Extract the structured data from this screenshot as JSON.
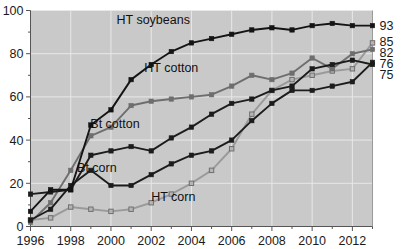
{
  "chart_data": {
    "type": "line",
    "title": "",
    "subtitle": "",
    "xlabel": "",
    "ylabel": "",
    "xlim": [
      1996,
      2013
    ],
    "ylim": [
      0,
      100
    ],
    "grid": true,
    "grid_color": "#e8e8e8",
    "plot_bg": "#c9c9c9",
    "legend": "inline-annotations",
    "x": [
      1996,
      1997,
      1998,
      1999,
      2000,
      2001,
      2002,
      2003,
      2004,
      2005,
      2006,
      2007,
      2008,
      2009,
      2010,
      2011,
      2012,
      2013
    ],
    "xticks": [
      1996,
      1998,
      2000,
      2002,
      2004,
      2006,
      2008,
      2010,
      2012
    ],
    "xtick_labels": [
      "1996",
      "1998",
      "2000",
      "2002",
      "2004",
      "2006",
      "2008",
      "2010",
      "2012"
    ],
    "xminor_ticks": [
      1997,
      1999,
      2001,
      2003,
      2005,
      2007,
      2009,
      2011,
      2013
    ],
    "yticks": [
      0,
      20,
      40,
      60,
      80,
      100
    ],
    "ytick_labels": [
      "0",
      "20",
      "40",
      "60",
      "80",
      "100"
    ],
    "yminor_ticks": [
      10,
      30,
      50,
      70,
      90
    ],
    "series": [
      {
        "name": "HT soybeans",
        "color": "#141414",
        "marker": "square-filled",
        "marker_fill": "#141414",
        "label_x": 2002.1,
        "label_y": 95.5,
        "end_value": 93,
        "values": [
          7,
          17,
          17,
          47,
          54,
          68,
          75,
          81,
          85,
          87,
          89,
          91,
          92,
          91,
          93,
          94,
          93,
          93
        ]
      },
      {
        "name": "HT cotton",
        "color": "#6e6e6e",
        "marker": "square-filled",
        "marker_fill": "#6e6e6e",
        "label_x": 2003.0,
        "label_y": 73.5,
        "end_value": 82,
        "values": [
          2,
          11,
          26,
          42,
          46,
          56,
          58,
          59,
          60,
          61,
          65,
          70,
          68,
          71,
          78,
          73,
          80,
          82
        ]
      },
      {
        "name": "Bt cotton",
        "color": "#1c1c1c",
        "marker": "square-filled",
        "marker_fill": "#1c1c1c",
        "label_x": 2000.2,
        "label_y": 47.5,
        "end_value": 75,
        "values": [
          15,
          16,
          17,
          33,
          35,
          37,
          35,
          41,
          46,
          52,
          57,
          59,
          63,
          65,
          73,
          75,
          77,
          75
        ]
      },
      {
        "name": "Bt corn",
        "color": "#1c1c1c",
        "marker": "square-filled",
        "marker_fill": "#1c1c1c",
        "label_x": 1999.3,
        "label_y": 27.0,
        "end_value": 76,
        "values": [
          3,
          8,
          19,
          26,
          19,
          19,
          24,
          29,
          33,
          35,
          40,
          49,
          57,
          63,
          63,
          65,
          67,
          76
        ]
      },
      {
        "name": "HT corn",
        "color": "#9a9a9a",
        "marker": "square-open",
        "marker_fill": "#b5b5b5",
        "label_x": 2003.1,
        "label_y": 13.5,
        "end_value": 85,
        "values": [
          3,
          4,
          9,
          8,
          7,
          8,
          11,
          15,
          20,
          26,
          36,
          52,
          63,
          68,
          70,
          72,
          73,
          85
        ]
      }
    ],
    "end_labels": [
      {
        "value": "93",
        "y": 93
      },
      {
        "value": "85",
        "y": 85.6
      },
      {
        "value": "82",
        "y": 80.4
      },
      {
        "value": "76",
        "y": 75.4
      },
      {
        "value": "75",
        "y": 70.2
      }
    ]
  }
}
